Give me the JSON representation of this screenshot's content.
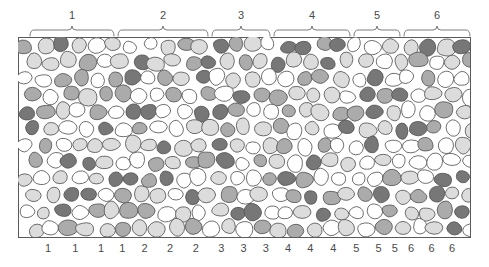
{
  "figure": {
    "title_visible": false,
    "panel": {
      "x": 18,
      "y": 37,
      "width": 452,
      "height": 200,
      "border_color": "#5a5a5a",
      "background": "#ffffff"
    },
    "palette": {
      "white": "#ffffff",
      "light_gray": "#dcdcdc",
      "mid_gray": "#ababab",
      "dark_gray": "#777777",
      "outline": "#555555",
      "text": "#4a4a4a",
      "brace": "#6e6e6e"
    }
  },
  "top_braces": [
    {
      "label": "1",
      "x_start": 30,
      "x_end": 114,
      "label_x": 72,
      "label_y": 19
    },
    {
      "label": "2",
      "x_start": 118,
      "x_end": 208,
      "label_x": 163,
      "label_y": 19
    },
    {
      "label": "3",
      "x_start": 212,
      "x_end": 270,
      "label_x": 241,
      "label_y": 19
    },
    {
      "label": "4",
      "x_start": 274,
      "x_end": 350,
      "label_x": 312,
      "label_y": 19
    },
    {
      "label": "5",
      "x_start": 354,
      "x_end": 400,
      "label_x": 377,
      "label_y": 19
    },
    {
      "label": "6",
      "x_start": 404,
      "x_end": 470,
      "label_x": 437,
      "label_y": 19
    }
  ],
  "bottom_ticks": [
    {
      "label": "1",
      "x": 53
    },
    {
      "label": "1",
      "x": 85
    },
    {
      "label": "1",
      "x": 115
    },
    {
      "label": "1",
      "x": 140
    },
    {
      "label": "2",
      "x": 166
    },
    {
      "label": "2",
      "x": 196
    },
    {
      "label": "2",
      "x": 226
    },
    {
      "label": "3",
      "x": 256
    },
    {
      "label": "3",
      "x": 282
    },
    {
      "label": "3",
      "x": 308
    },
    {
      "label": "4",
      "x": 334
    },
    {
      "label": "4",
      "x": 360
    },
    {
      "label": "4",
      "x": 387
    },
    {
      "label": "5",
      "x": 414
    },
    {
      "label": "5",
      "x": 440
    },
    {
      "label": "5",
      "x": 459
    },
    {
      "label": "6",
      "x": 478
    },
    {
      "label": "6",
      "x": 502
    },
    {
      "label": "6",
      "x": 526
    }
  ],
  "chart_data": {
    "type": "diagram",
    "group_count": 6,
    "tick_count": 19,
    "cell_tone_counts": {
      "white": 0,
      "light_gray": 0,
      "mid_gray": 0,
      "dark_gray": 0
    }
  }
}
